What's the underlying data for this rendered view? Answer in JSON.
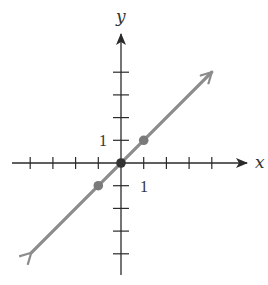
{
  "chart_data": {
    "type": "line",
    "title": "",
    "xlabel": "x",
    "ylabel": "y",
    "xlim": [
      -4,
      4
    ],
    "ylim": [
      -5,
      4
    ],
    "grid": false,
    "legend": null,
    "x_tick_label": "1",
    "y_tick_label": "1",
    "x_ticks": [
      -4,
      -3,
      -2,
      -1,
      1,
      2,
      3,
      4
    ],
    "y_ticks": [
      -4,
      -3,
      -2,
      -1,
      1,
      2,
      3,
      4
    ],
    "series": [
      {
        "name": "y = x",
        "equation": "y = x",
        "line_x": [
          -4,
          4
        ],
        "line_y": [
          -4,
          4
        ],
        "arrows_both_ends": true,
        "points": [
          [
            -1,
            -1
          ],
          [
            0,
            0
          ],
          [
            1,
            1
          ]
        ]
      }
    ],
    "colors": {
      "axis": "#2a2a2a",
      "line": "#8c8c8c",
      "point": "#7a7a7a",
      "origin_point": "#333333"
    }
  },
  "labels": {
    "x_axis": "x",
    "y_axis": "y",
    "x_unit": "1",
    "y_unit": "1"
  }
}
